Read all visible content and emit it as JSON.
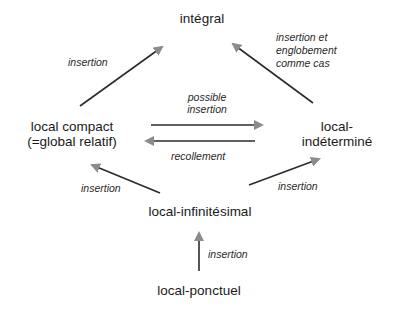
{
  "diagram": {
    "nodes": {
      "integral": {
        "label": "intégral"
      },
      "local_compact": {
        "line1": "local compact",
        "line2": "(=global relatif)"
      },
      "local_indetermine": {
        "line1": "local-",
        "line2": "indéterminé"
      },
      "local_infinitesimal": {
        "label": "local-infinitésimal"
      },
      "local_ponctuel": {
        "label": "local-ponctuel"
      }
    },
    "edges": [
      {
        "from": "local compact",
        "to": "intégral",
        "label": "insertion"
      },
      {
        "from": "local-indéterminé",
        "to": "intégral",
        "label_lines": [
          "insertion et",
          "englobement",
          "comme cas"
        ]
      },
      {
        "from": "local compact",
        "to": "local-indéterminé",
        "label_lines": [
          "possible",
          "insertion"
        ]
      },
      {
        "from": "local-indéterminé",
        "to": "local compact",
        "label": "recollement"
      },
      {
        "from": "local-infinitésimal",
        "to": "local compact",
        "label": "insertion"
      },
      {
        "from": "local-infinitésimal",
        "to": "local-indéterminé",
        "label": "insertion"
      },
      {
        "from": "local-ponctuel",
        "to": "local-infinitésimal",
        "label": "insertion"
      }
    ],
    "colors": {
      "line": "#2b2b2b",
      "arrowhead": "#8c8c8c",
      "text": "#1a1a1a"
    }
  }
}
